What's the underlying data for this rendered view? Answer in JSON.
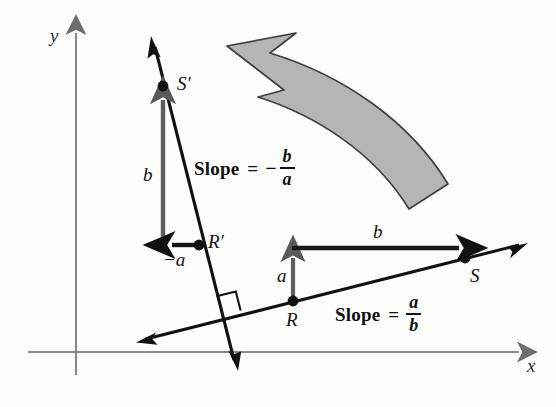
{
  "figure": {
    "background_color": "#fdfdfc",
    "ink_color": "#111111",
    "gray_fill": "#b5b5b5",
    "gray_stroke": "#4a4a4a",
    "vector_color": "#555555"
  },
  "axes": {
    "x_label": "x",
    "y_label": "y",
    "x_axis": {
      "x1": 28,
      "y1": 352,
      "x2": 527,
      "y2": 352
    },
    "y_axis": {
      "x1": 76,
      "y1": 375,
      "x2": 76,
      "y2": 25
    }
  },
  "points": [
    {
      "id": "R",
      "label": "R",
      "x": 293,
      "y": 301,
      "label_x": 286,
      "label_y": 310
    },
    {
      "id": "S",
      "label": "S",
      "x": 465,
      "y": 258,
      "label_x": 470,
      "label_y": 266
    },
    {
      "id": "Rp",
      "label": "R′",
      "x": 199,
      "y": 245,
      "label_x": 208,
      "label_y": 232
    },
    {
      "id": "Sp",
      "label": "S′",
      "x": 163,
      "y": 86,
      "label_x": 177,
      "label_y": 74
    }
  ],
  "segments": [
    {
      "id": "b_horizontal",
      "label": "b",
      "label_x": 381,
      "label_y": 233,
      "from": "R_up",
      "to": "S"
    },
    {
      "id": "a_vertical",
      "label": "a",
      "label_x": 280,
      "label_y": 272,
      "from": "R",
      "to": "R_up"
    },
    {
      "id": "b_vertical",
      "label": "b",
      "label_x": 148,
      "label_y": 168,
      "from": "Rp_down",
      "to": "Sp"
    },
    {
      "id": "neg_a_horizontal",
      "label": "−a",
      "label_x": 170,
      "label_y": 252,
      "from": "Rp",
      "to": "Rp_left"
    }
  ],
  "slope_labels": [
    {
      "id": "slope_positive",
      "word": "Slope",
      "equals": "=",
      "sign": "",
      "numerator": "a",
      "denominator": "b",
      "x": 335,
      "y": 293,
      "full_text": "Slope = a/b"
    },
    {
      "id": "slope_negative",
      "word": "Slope",
      "equals": "=",
      "sign": "−",
      "numerator": "b",
      "denominator": "a",
      "x": 194,
      "y": 148,
      "full_text": "Slope = -b/a"
    }
  ],
  "annotations": {
    "right_angle_marker": {
      "x": 238,
      "y": 300,
      "size": 20
    },
    "rotation_arrow": {
      "name": "counterclockwise-rotation-arrow",
      "direction": "counterclockwise",
      "fill": "#b5b5b5",
      "stroke": "#3f3f3f"
    }
  }
}
